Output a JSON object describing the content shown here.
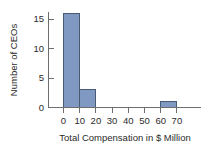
{
  "chart_data": {
    "type": "bar",
    "title": "",
    "subtitle": "",
    "xlabel": "Total Compensation in $ Million",
    "ylabel": "Number of CEOs",
    "bin_width": 10,
    "bin_starts": [
      0,
      10,
      20,
      30,
      40,
      50,
      60
    ],
    "categories": [
      "0-10",
      "10-20",
      "20-30",
      "30-40",
      "40-50",
      "50-60",
      "60-70"
    ],
    "values": [
      16,
      3,
      0,
      0,
      0,
      0,
      1
    ],
    "xlim": [
      0,
      70
    ],
    "ylim": [
      0,
      16
    ],
    "xticks": [
      0,
      10,
      20,
      30,
      40,
      50,
      60,
      70
    ],
    "xtick_labels": [
      "0",
      "10",
      "20",
      "30",
      "40",
      "50",
      "60",
      "70"
    ],
    "yticks": [
      0,
      5,
      10,
      15
    ],
    "ytick_labels": [
      "0",
      "5",
      "10",
      "15"
    ],
    "grid": false,
    "legend": null,
    "bar_fill_color": "#8099c2",
    "bar_edge_color": "#4a5a74",
    "axis_color": "#6e6e6e",
    "background_color": "#ffffff"
  }
}
